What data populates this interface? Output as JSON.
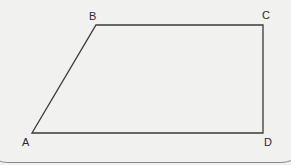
{
  "figure": {
    "shape": "trapezoid",
    "stroke_color": "#3a3a3a",
    "background": "#f1f1f0",
    "vertices": [
      {
        "name": "A",
        "x": 32,
        "y": 133,
        "label_x": 22,
        "label_y": 136
      },
      {
        "name": "B",
        "x": 96,
        "y": 25,
        "label_x": 89,
        "label_y": 10
      },
      {
        "name": "C",
        "x": 263,
        "y": 25,
        "label_x": 262,
        "label_y": 9
      },
      {
        "name": "D",
        "x": 263,
        "y": 133,
        "label_x": 264,
        "label_y": 136
      }
    ]
  },
  "labels": {
    "A": "A",
    "B": "B",
    "C": "C",
    "D": "D"
  }
}
